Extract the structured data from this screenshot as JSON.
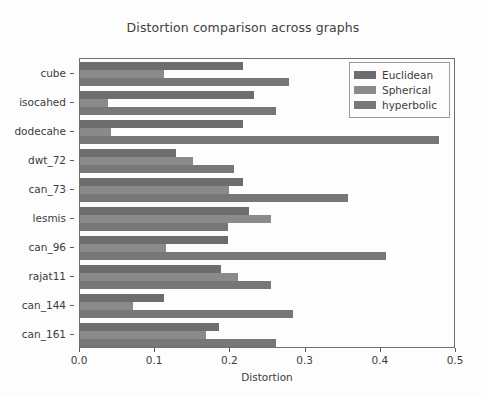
{
  "chart_data": {
    "type": "bar",
    "orientation": "horizontal",
    "title": "Distortion comparison across graphs",
    "xlabel": "Distortion",
    "ylabel": "",
    "xlim": [
      0.0,
      0.5
    ],
    "xticks": [
      0.0,
      0.1,
      0.2,
      0.3,
      0.4,
      0.5
    ],
    "xtick_labels": [
      "0.0",
      "0.1",
      "0.2",
      "0.3",
      "0.4",
      "0.5"
    ],
    "grid": false,
    "legend_position": "upper right",
    "categories": [
      "cube",
      "isocahed",
      "dodecahe",
      "dwt_72",
      "can_73",
      "lesmis",
      "can_96",
      "rajat11",
      "can_144",
      "can_161"
    ],
    "series": [
      {
        "name": "Euclidean",
        "color": "#6d6d6d",
        "values": [
          0.217,
          0.231,
          0.217,
          0.128,
          0.217,
          0.225,
          0.197,
          0.188,
          0.112,
          0.185
        ]
      },
      {
        "name": "Spherical",
        "color": "#8a8a8a",
        "values": [
          0.112,
          0.037,
          0.041,
          0.15,
          0.198,
          0.254,
          0.114,
          0.21,
          0.07,
          0.168
        ]
      },
      {
        "name": "hyperbolic",
        "color": "#777777",
        "values": [
          0.278,
          0.261,
          0.477,
          0.205,
          0.356,
          0.197,
          0.407,
          0.254,
          0.283,
          0.261
        ]
      }
    ]
  }
}
